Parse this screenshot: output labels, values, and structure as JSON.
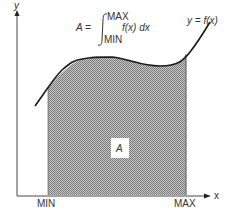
{
  "formula": {
    "lhs": "A =",
    "upper": "MAX",
    "lower": "MIN",
    "integrand": "f(x) dx"
  },
  "axes": {
    "y_label": "y",
    "x_label": "x"
  },
  "curve_label": "y = f(x)",
  "area_label": "A",
  "x_ticks": {
    "min": "MIN",
    "max": "MAX"
  },
  "colors": {
    "line": "#1a1a1a",
    "fill": "#a8a8a8",
    "text": "#333333"
  }
}
